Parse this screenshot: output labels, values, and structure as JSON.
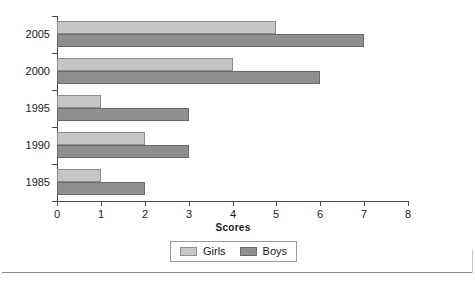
{
  "chart_data": {
    "type": "bar",
    "orientation": "horizontal",
    "title": "",
    "xlabel": "Scores",
    "ylabel": "",
    "categories": [
      "1985",
      "1990",
      "1995",
      "2000",
      "2005"
    ],
    "series": [
      {
        "name": "Girls",
        "color": "#c6c6c6",
        "values": [
          1,
          2,
          1,
          4,
          5
        ]
      },
      {
        "name": "Boys",
        "color": "#8f8f8f",
        "values": [
          2,
          3,
          3,
          6,
          7
        ]
      }
    ],
    "xlim": [
      0,
      8
    ],
    "xticks": [
      "0",
      "1",
      "2",
      "3",
      "4",
      "5",
      "6",
      "7",
      "8"
    ],
    "grid": false,
    "legend": {
      "position": "bottom",
      "entries": [
        {
          "label": "Girls",
          "color": "#c6c6c6"
        },
        {
          "label": "Boys",
          "color": "#8f8f8f"
        }
      ]
    }
  }
}
